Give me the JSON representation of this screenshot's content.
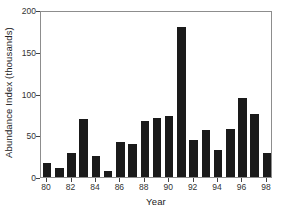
{
  "chart_data": {
    "type": "bar",
    "title": "",
    "xlabel": "Year",
    "ylabel": "Abundance Index (thousands)",
    "categories": [
      "80",
      "81",
      "82",
      "83",
      "84",
      "85",
      "86",
      "87",
      "88",
      "89",
      "90",
      "91",
      "92",
      "93",
      "94",
      "95",
      "96",
      "97",
      "98"
    ],
    "values": [
      17,
      11,
      29,
      70,
      25,
      7,
      42,
      39,
      67,
      71,
      73,
      180,
      44,
      56,
      32,
      57,
      95,
      76,
      29
    ],
    "xtick_labels": [
      "80",
      "82",
      "84",
      "86",
      "88",
      "90",
      "92",
      "94",
      "96",
      "98"
    ],
    "ytick_labels": [
      "0",
      "50",
      "100",
      "150",
      "200"
    ],
    "ytick_values": [
      0,
      50,
      100,
      150,
      200
    ],
    "ylim": [
      0,
      200
    ],
    "grid": false,
    "legend": null,
    "bar_color": "#1a1a1a",
    "frame_color": "#8d8d8d",
    "background_color": "#ffffff"
  }
}
